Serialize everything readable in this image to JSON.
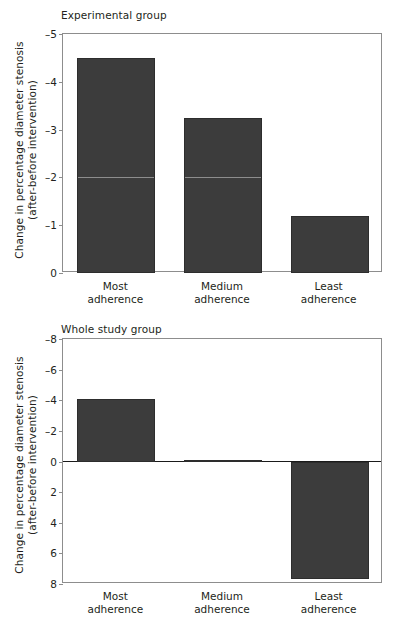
{
  "figure": {
    "categories": [
      "Most\nadherence",
      "Medium\nadherence",
      "Least\nadherence"
    ],
    "ylabel_line1": "Change in percentage diameter stenosis",
    "ylabel_line2": "(after–before intervention)",
    "bar_color": "#3c3c3c",
    "frame_color": "#8d8d8d"
  },
  "panels": [
    {
      "title": "Experimental group",
      "categories": [
        {
          "line1": "Most",
          "line2": "adherence"
        },
        {
          "line1": "Medium",
          "line2": "adherence"
        },
        {
          "line1": "Least",
          "line2": "adherence"
        }
      ],
      "yticks": [
        "-5",
        "-4",
        "-3",
        "-2",
        "-1",
        "0"
      ],
      "ylabel_line1": "Change in percentage diameter stenosis",
      "ylabel_line2": "(after-before intervention)"
    },
    {
      "title": "Whole study group",
      "categories": [
        {
          "line1": "Most",
          "line2": "adherence"
        },
        {
          "line1": "Medium",
          "line2": "adherence"
        },
        {
          "line1": "Least",
          "line2": "adherence"
        }
      ],
      "yticks": [
        "-8",
        "-6",
        "-4",
        "-2",
        "0",
        "2",
        "4",
        "6",
        "8"
      ],
      "ylabel_line1": "Change in percentage diameter stenosis",
      "ylabel_line2": "(after-before intervention)"
    }
  ],
  "chart_data": [
    {
      "type": "bar",
      "title": "Experimental group",
      "xlabel": "",
      "ylabel": "Change in percentage diameter stenosis (after-before intervention)",
      "categories": [
        "Most adherence",
        "Medium adherence",
        "Least adherence"
      ],
      "values": [
        -4.5,
        -3.25,
        -1.2
      ],
      "ytick_labels": [
        "-5",
        "-4",
        "-3",
        "-2",
        "-1",
        "0"
      ],
      "ytick_values": [
        -5,
        -4,
        -3,
        -2,
        -1,
        0
      ],
      "ylim": [
        -5,
        0
      ],
      "y_axis_inverted": true,
      "grid": false,
      "legend": "none",
      "bar_color": "#3c3c3c"
    },
    {
      "type": "bar",
      "title": "Whole study group",
      "xlabel": "",
      "ylabel": "Change in percentage diameter stenosis (after-before intervention)",
      "categories": [
        "Most adherence",
        "Medium adherence",
        "Least adherence"
      ],
      "values": [
        -4.1,
        -0.1,
        7.7
      ],
      "ytick_labels": [
        "-8",
        "-6",
        "-4",
        "-2",
        "0",
        "2",
        "4",
        "6",
        "8"
      ],
      "ytick_values": [
        -8,
        -6,
        -4,
        -2,
        0,
        2,
        4,
        6,
        8
      ],
      "ylim": [
        -8,
        8
      ],
      "y_axis_inverted": true,
      "zero_line": true,
      "grid": false,
      "legend": "none",
      "bar_color": "#3c3c3c"
    }
  ]
}
